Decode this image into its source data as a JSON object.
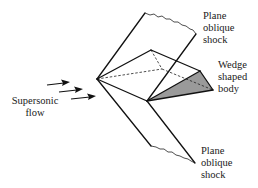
{
  "diagram": {
    "labels": {
      "upper_shock": [
        "Plane",
        "oblique",
        "shock"
      ],
      "lower_shock": [
        "Plane",
        "oblique",
        "shock"
      ],
      "wedge": [
        "Wedge",
        "shaped",
        "body"
      ],
      "flow": [
        "Supersonic",
        "flow"
      ]
    },
    "colors": {
      "line": "#111111",
      "shaded_face": "#9a9a9a",
      "background": "#ffffff"
    },
    "flow_arrows": 3
  }
}
